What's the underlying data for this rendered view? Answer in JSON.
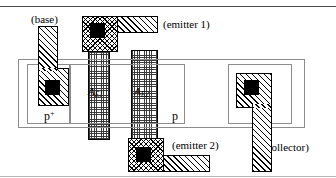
{
  "figure": {
    "top_rule": true,
    "bottom_rule": true
  },
  "labels": {
    "base": "(base)",
    "emitter1": "(emitter 1)",
    "emitter2": "(emitter 2)",
    "collector": "(collector)",
    "p_plus": "p",
    "p_plus_sup": "+",
    "p": "p",
    "area_e1": "A",
    "area_e1_sub": "E1",
    "area_e2": "A",
    "area_e2_sub": "E2"
  },
  "colors": {
    "ink": "#000000",
    "outline": "#8c8c8c",
    "rule": "#4a4a4a",
    "contact_fill": "#000000",
    "background": "#ffffff"
  },
  "geometry": {
    "canvas_w": 336,
    "canvas_h": 178,
    "outer_tub": {
      "x": 18,
      "y": 59,
      "w": 287,
      "h": 69
    },
    "p_plus_well": {
      "x": 27,
      "y": 64,
      "w": 43,
      "h": 60
    },
    "p_well": {
      "x": 70,
      "y": 64,
      "w": 115,
      "h": 60
    },
    "collector_well": {
      "x": 228,
      "y": 64,
      "w": 64,
      "h": 60
    },
    "emitter_stripe_1": {
      "x": 88,
      "y": 16,
      "w": 22,
      "h": 124
    },
    "emitter_stripe_2": {
      "x": 131,
      "y": 50,
      "w": 27,
      "h": 122
    }
  }
}
